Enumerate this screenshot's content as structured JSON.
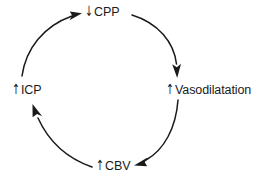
{
  "diagram": {
    "type": "cycle",
    "direction": "counter-clockwise",
    "background_color": "#ffffff",
    "stroke_color": "#1a1a1a",
    "text_color": "#1a1a1a",
    "nodes": [
      {
        "id": "cpp",
        "arrow": "↓",
        "arrow_name": "down-arrow-icon",
        "arrow_meaning": "decrease",
        "text": "CPP",
        "full_label": "↓CPP",
        "position": "top"
      },
      {
        "id": "vasodilatation",
        "arrow": "↑",
        "arrow_name": "up-arrow-icon",
        "arrow_meaning": "increase",
        "text": "Vasodilatation",
        "full_label": "↑Vasodilatation",
        "position": "right"
      },
      {
        "id": "cbv",
        "arrow": "↑",
        "arrow_name": "up-arrow-icon",
        "arrow_meaning": "increase",
        "text": "CBV",
        "full_label": "↑CBV",
        "position": "bottom"
      },
      {
        "id": "icp",
        "arrow": "↑",
        "arrow_name": "up-arrow-icon",
        "arrow_meaning": "increase",
        "text": "ICP",
        "full_label": "↑ICP",
        "position": "left"
      }
    ],
    "edges": [
      {
        "id": "edge-cpp-vasodilatation",
        "from": "cpp",
        "to": "vasodilatation",
        "arrowhead": "down"
      },
      {
        "id": "edge-vasodilatation-cbv",
        "from": "vasodilatation",
        "to": "cbv",
        "arrowhead": "left"
      },
      {
        "id": "edge-cbv-icp",
        "from": "cbv",
        "to": "icp",
        "arrowhead": "up"
      },
      {
        "id": "edge-icp-cpp",
        "from": "icp",
        "to": "cpp",
        "arrowhead": "right"
      }
    ]
  }
}
